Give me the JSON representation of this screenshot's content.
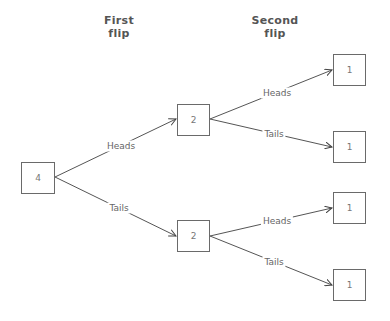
{
  "headers": {
    "first": {
      "line1": "First",
      "line2": "flip"
    },
    "second": {
      "line1": "Second",
      "line2": "flip"
    }
  },
  "nodes": {
    "root": {
      "value": "4"
    },
    "level1_heads": {
      "value": "2"
    },
    "level1_tails": {
      "value": "2"
    },
    "hh": {
      "value": "1"
    },
    "ht": {
      "value": "1"
    },
    "th": {
      "value": "1"
    },
    "tt": {
      "value": "1"
    }
  },
  "edges": {
    "root_heads": {
      "label": "Heads"
    },
    "root_tails": {
      "label": "Tails"
    },
    "h_heads": {
      "label": "Heads"
    },
    "h_tails": {
      "label": "Tails"
    },
    "t_heads": {
      "label": "Heads"
    },
    "t_tails": {
      "label": "Tails"
    }
  },
  "colors": {
    "line": "#555555",
    "box_border": "#6a6a6a",
    "text": "#666666"
  }
}
